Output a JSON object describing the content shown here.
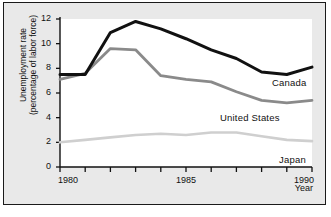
{
  "chart_data": {
    "type": "line",
    "title": "",
    "xlabel": "Year",
    "ylabel": "Unemployment rate (percentage of labor force)",
    "ylabel_line1": "Unemployment rate",
    "ylabel_line2": "(percentage of labor force)",
    "x": [
      1980,
      1981,
      1982,
      1983,
      1984,
      1985,
      1986,
      1987,
      1988,
      1989,
      1990
    ],
    "xlim": [
      1980,
      1990
    ],
    "ylim": [
      0,
      12
    ],
    "xticks": [
      1980,
      1981,
      1982,
      1983,
      1984,
      1985,
      1986,
      1987,
      1988,
      1989,
      1990
    ],
    "xtick_labels": [
      "1980",
      "",
      "",
      "",
      "",
      "1985",
      "",
      "",
      "",
      "",
      "1990"
    ],
    "yticks": [
      0,
      2,
      4,
      6,
      8,
      10,
      12
    ],
    "ytick_labels": [
      "0",
      "2",
      "4",
      "6",
      "8",
      "10",
      "12"
    ],
    "grid": false,
    "legend_position": "inline-right",
    "series": [
      {
        "name": "Canada",
        "color": "#111111",
        "values": [
          7.5,
          7.5,
          10.9,
          11.8,
          11.2,
          10.4,
          9.5,
          8.8,
          7.7,
          7.5,
          8.1
        ]
      },
      {
        "name": "United States",
        "color": "#8a8a8a",
        "values": [
          7.1,
          7.6,
          9.6,
          9.5,
          7.4,
          7.1,
          6.9,
          6.1,
          5.4,
          5.2,
          5.4
        ]
      },
      {
        "name": "Japan",
        "color": "#cfcfcf",
        "values": [
          2.0,
          2.2,
          2.4,
          2.6,
          2.7,
          2.6,
          2.8,
          2.8,
          2.5,
          2.2,
          2.1
        ]
      }
    ]
  },
  "axes": {
    "y_title_line1": "Unemployment rate",
    "y_title_line2": "(percentage of labor force)",
    "x_title": "Year"
  },
  "series_labels": {
    "canada": "Canada",
    "united_states": "United States",
    "japan": "Japan"
  },
  "caption": {
    "text": ""
  }
}
